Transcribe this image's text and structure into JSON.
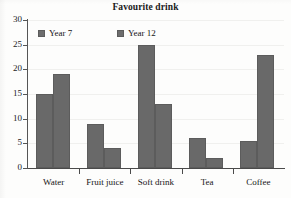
{
  "chart_data": {
    "type": "bar",
    "title": "Favourite drink",
    "xlabel": "",
    "ylabel": "",
    "ylim": [
      0,
      30
    ],
    "yticks": [
      0,
      5,
      10,
      15,
      20,
      25,
      30
    ],
    "ytick_labels": [
      "0",
      "5",
      "10",
      "15",
      "20",
      "25",
      "30"
    ],
    "grid": true,
    "legend_position": "top-inside-left",
    "categories": [
      "Water",
      "Fruit juice",
      "Soft drink",
      "Tea",
      "Coffee"
    ],
    "series": [
      {
        "name": "Year 7",
        "color": "#696969",
        "values": [
          15,
          9,
          25,
          6,
          5.5
        ]
      },
      {
        "name": "Year 12",
        "color": "#696969",
        "values": [
          19,
          4,
          13,
          2,
          23
        ]
      }
    ]
  },
  "legend": {
    "items": [
      {
        "label": "Year 7"
      },
      {
        "label": "Year 12"
      }
    ]
  },
  "colors": {
    "bar_fill": "#696969",
    "bar_stroke": "#5c5c5c",
    "axis": "#4a4a4a",
    "text": "#151515",
    "background": "#fdfdfc"
  }
}
